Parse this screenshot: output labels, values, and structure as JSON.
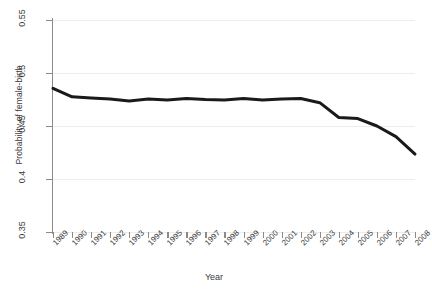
{
  "chart_data": {
    "type": "line",
    "title": "",
    "xlabel": "Year",
    "ylabel": "Probability of female-birth",
    "xlim": [
      1989,
      2008
    ],
    "ylim": [
      0.35,
      0.55
    ],
    "yticks": [
      "0.35",
      "0.4",
      "0.45",
      "0.5",
      "0.55"
    ],
    "ytick_values": [
      0.35,
      0.4,
      0.45,
      0.5,
      0.55
    ],
    "grid": true,
    "legend": "none",
    "line_color": "#1a1a1a",
    "line_width": 3,
    "categories": [
      "1989",
      "1990",
      "1991",
      "1992",
      "1993",
      "1994",
      "1995",
      "1996",
      "1997",
      "1998",
      "1999",
      "2000",
      "2001",
      "2002",
      "2003",
      "2004",
      "2005",
      "2006",
      "2007",
      "2008"
    ],
    "values": [
      0.4855,
      0.4775,
      0.4765,
      0.4755,
      0.4735,
      0.4755,
      0.4745,
      0.476,
      0.475,
      0.4745,
      0.476,
      0.4745,
      0.4755,
      0.476,
      0.472,
      0.458,
      0.457,
      0.45,
      0.44,
      0.4235
    ]
  }
}
